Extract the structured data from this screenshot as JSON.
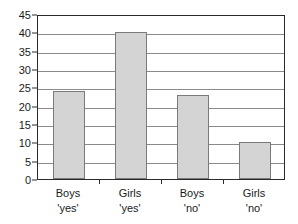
{
  "chart_data": {
    "type": "bar",
    "title": "",
    "subtitle": "",
    "xlabel": "",
    "ylabel": "",
    "categories": [
      "Boys 'yes'",
      "Girls 'yes'",
      "Boys 'no'",
      "Girls 'no'"
    ],
    "category_lines": [
      [
        "Boys",
        "'yes'"
      ],
      [
        "Girls",
        "'yes'"
      ],
      [
        "Boys",
        "'no'"
      ],
      [
        "Girls",
        "'no'"
      ]
    ],
    "values": [
      24,
      40,
      23,
      10
    ],
    "ylim": [
      0,
      45
    ],
    "ytick_step": 5,
    "yticks": [
      0,
      5,
      10,
      15,
      20,
      25,
      30,
      35,
      40,
      45
    ],
    "ytick_labels": [
      "0",
      "5",
      "10",
      "15",
      "20",
      "25",
      "30",
      "35",
      "40",
      "45"
    ],
    "grid": true,
    "grid_axis": "y",
    "legend": false,
    "legend_position": "none",
    "colors": {
      "bar_fill": "#d4d4d4",
      "bar_border": "#7a7a7a",
      "gridline": "#8a8a8a",
      "axis": "#2b2b2b",
      "text": "#1a1a1a",
      "background": "#ffffff"
    }
  }
}
